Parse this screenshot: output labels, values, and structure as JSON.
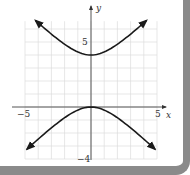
{
  "chart_data": {
    "type": "line",
    "title": "",
    "xlabel": "x",
    "ylabel": "y",
    "xlim": [
      -5,
      5
    ],
    "ylim": [
      -4,
      6.6
    ],
    "grid": true,
    "x_ticks": [
      {
        "value": -5,
        "label": "−5"
      },
      {
        "value": 5,
        "label": "5"
      }
    ],
    "y_ticks": [
      {
        "value": 5,
        "label": "5"
      },
      {
        "value": -4,
        "label": "−4"
      }
    ],
    "equation": "(y−2)²/4 − x²/4 = 1",
    "series": [
      {
        "name": "upper branch",
        "vertex": [
          0,
          4
        ],
        "arrow_ends": [
          [
            -4.2,
            6.7
          ],
          [
            4.2,
            6.7
          ]
        ]
      },
      {
        "name": "lower branch",
        "vertex": [
          0,
          0
        ],
        "arrow_ends": [
          [
            -4.85,
            -3.5
          ],
          [
            4.85,
            -3.5
          ]
        ]
      }
    ],
    "colors": {
      "curve": "#1a1a1a",
      "axis": "#333333",
      "grid": "#d6d6d6"
    }
  },
  "labels": {
    "x_axis": "x",
    "y_axis": "y",
    "x_min": "−5",
    "x_max": "5",
    "y_tick": "5",
    "y_min": "−4"
  }
}
